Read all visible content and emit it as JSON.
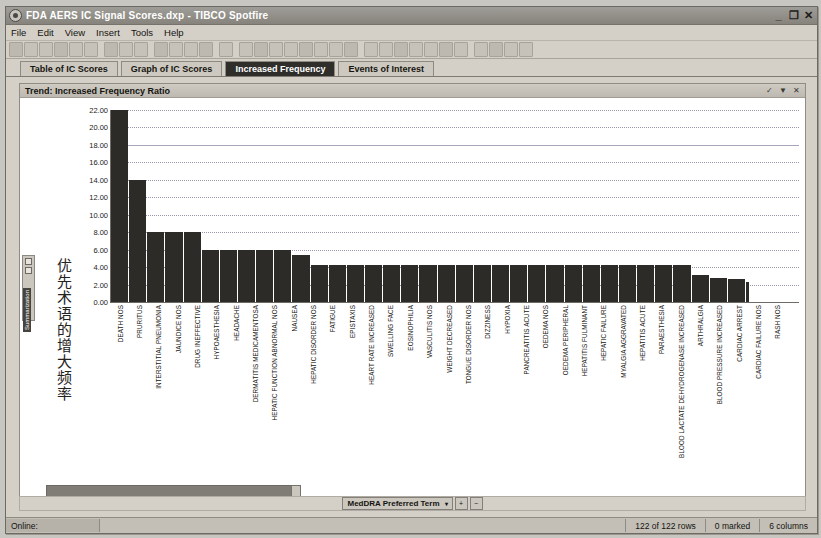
{
  "window": {
    "title": "FDA AERS IC Signal Scores.dxp - TIBCO Spotfire",
    "app_icon": "eye-icon",
    "minimize_glyph": "_",
    "maximize_glyph": "❐",
    "close_glyph": "✕"
  },
  "menubar": {
    "items": [
      "File",
      "Edit",
      "View",
      "Insert",
      "Tools",
      "Help"
    ]
  },
  "toolbar": {
    "icons": [
      "open-icon",
      "save-icon",
      "export-icon",
      "print-icon",
      "print-preview-icon",
      "add-page-icon",
      "copy-icon",
      "paste-icon",
      "find-icon",
      "undo-icon",
      "redo-icon",
      "refresh-icon",
      "star-icon",
      "home-icon",
      "table-icon",
      "cross-table-icon",
      "bar-chart-icon",
      "line-chart-icon",
      "pie-chart-icon",
      "scatter-icon",
      "map-chart-icon",
      "heat-map-icon",
      "treemap-icon",
      "box-plot-icon",
      "parallel-coord-icon",
      "text-area-icon",
      "graphical-table-icon",
      "kpi-icon",
      "details-icon",
      "filter-icon",
      "marking-icon",
      "tag-icon",
      "details-on-demand-icon"
    ]
  },
  "tabs": [
    {
      "label": "Table of IC Scores",
      "active": false
    },
    {
      "label": "Graph of IC Scores",
      "active": false
    },
    {
      "label": "Increased Frequency",
      "active": true
    },
    {
      "label": "Events of Interest",
      "active": false
    }
  ],
  "panel": {
    "title": "Trend: Increased Frequency Ratio",
    "header_buttons": [
      "maximize-panel-icon",
      "panel-menu-icon",
      "close-panel-icon"
    ],
    "header_glyphs": [
      "✓",
      "▼",
      "✕"
    ]
  },
  "side_panel": {
    "label": "Summarization"
  },
  "axis_selector": {
    "label": "MedDRA Preferred Term",
    "dropdown_glyph": "▾",
    "zoom_in": "+",
    "zoom_out": "−"
  },
  "statusbar": {
    "online": "Online:",
    "rows": "122 of 122 rows",
    "marked": "0 marked",
    "columns": "6 columns"
  },
  "chart_data": {
    "type": "bar",
    "title": "Trend: Increased Frequency Ratio",
    "xlabel": "MedDRA Preferred Term",
    "ylabel": "优先术语的增大频率",
    "ylim": [
      0,
      22
    ],
    "yticks": [
      "0.00",
      "2.00",
      "4.00",
      "6.00",
      "8.00",
      "10.00",
      "12.00",
      "14.00",
      "16.00",
      "18.00",
      "20.00",
      "22.00"
    ],
    "grid": true,
    "legend": "none",
    "bar_color": "#2c2b28",
    "categories": [
      "DEATH NOS",
      "PRURITUS",
      "INTERSTITIAL PNEUMONIA",
      "JAUNDICE NOS",
      "DRUG INEFFECTIVE",
      "HYPOAESTHESIA",
      "HEADACHE",
      "DERMATITIS MEDICAMENTOSA",
      "HEPATIC FUNCTION ABNORMAL NOS",
      "NAUSEA",
      "HEPATIC DISORDER NOS",
      "FATIGUE",
      "EPISTAXIS",
      "HEART RATE INCREASED",
      "SWELLING FACE",
      "EOSINOPHILIA",
      "VASCULITIS NOS",
      "WEIGHT DECREASED",
      "TONGUE DISORDER NOS",
      "DIZZINESS",
      "HYPOXIA",
      "PANCREATITIS ACUTE",
      "OEDEMA NOS",
      "OEDEMA PERIPHERAL",
      "HEPATITIS FULMINANT",
      "HEPATIC FAILURE",
      "MYALGIA AGGRAVATED",
      "HEPATITIS ACUTE",
      "PARAESTHESIA",
      "BLOOD LACTATE DEHYDROGENASE INCREASED",
      "ARTHRALGIA",
      "BLOOD PRESSURE INCREASED",
      "CARDIAC ARREST",
      "CARDIAC FAILURE NOS",
      "RASH NOS"
    ],
    "values": [
      22.0,
      14.0,
      8.0,
      8.0,
      8.0,
      6.0,
      6.0,
      6.0,
      6.0,
      6.0,
      5.4,
      4.2,
      4.2,
      4.2,
      4.2,
      4.2,
      4.2,
      4.2,
      4.2,
      4.2,
      4.2,
      4.2,
      4.2,
      4.2,
      4.2,
      4.2,
      4.2,
      4.2,
      4.2,
      4.2,
      4.2,
      4.2,
      3.1,
      2.7,
      2.6
    ]
  }
}
